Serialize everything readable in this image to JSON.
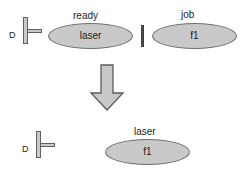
{
  "diagram": {
    "colors": {
      "shape_fill": "#c9c9c9",
      "shape_stroke": "#6f6f6f",
      "arrow_fill": "#c9c9c9",
      "arrow_stroke": "#5a5a5a",
      "separator": "#555555",
      "text": "#1d1d1d",
      "background": "#ffffff"
    },
    "before": {
      "port": {
        "label": "D"
      },
      "separator": {
        "name": "vertical-bar"
      },
      "nodes": [
        {
          "top_label": "ready",
          "inner_label": "laser"
        },
        {
          "top_label": "job",
          "inner_label": "f1"
        }
      ]
    },
    "transform": {
      "arrow": {
        "direction": "down",
        "glyph": "block-arrow"
      }
    },
    "after": {
      "port": {
        "label": "D"
      },
      "nodes": [
        {
          "top_label": "laser",
          "inner_label": "f1"
        }
      ]
    }
  }
}
